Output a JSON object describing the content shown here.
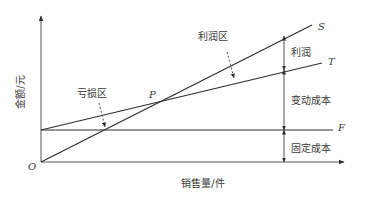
{
  "diagram": {
    "type": "break-even chart",
    "y_axis_label": "金额/元",
    "x_axis_label": "销售量/件",
    "origin_label": "O",
    "lines": {
      "sales": {
        "label": "S"
      },
      "total_cost": {
        "label": "T"
      },
      "fixed_cost": {
        "label": "F"
      }
    },
    "break_even_point": {
      "label": "P"
    },
    "regions": {
      "profit_zone": "利润区",
      "loss_zone": "亏损区"
    },
    "dimensions": {
      "profit": "利润",
      "variable_cost": "变动成本",
      "fixed_cost": "固定成本"
    }
  }
}
